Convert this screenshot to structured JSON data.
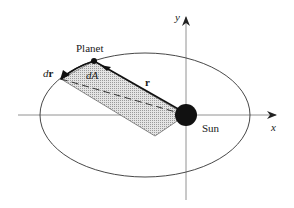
{
  "figure": {
    "labels": {
      "planet": "Planet",
      "sun": "Sun",
      "radius_vector": "r",
      "dr_prefix": "d",
      "dr_vec": "r",
      "dA": "dA",
      "x_axis": "x",
      "y_axis": "y"
    },
    "colors": {
      "line": "#333333",
      "axis": "#777777",
      "sun": "#111111",
      "shade": "#c8c8c8",
      "background": "#ffffff"
    }
  }
}
